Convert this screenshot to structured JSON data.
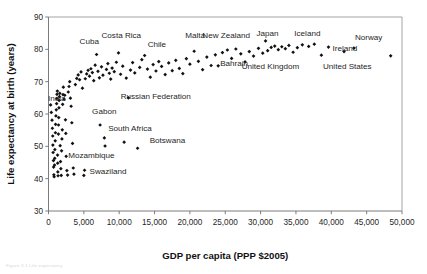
{
  "figure": {
    "caption_fragment": "Figure 3.1  Life expectancy"
  },
  "chart_data": {
    "type": "scatter",
    "title": "",
    "xlabel": "GDP per capita (PPP $2005)",
    "ylabel": "Life expectancy at birth (years)",
    "xlim": [
      0,
      50000
    ],
    "ylim": [
      30,
      90
    ],
    "xticks": [
      0,
      5000,
      10000,
      15000,
      20000,
      25000,
      30000,
      35000,
      40000,
      45000,
      50000
    ],
    "xticklabels": [
      "0",
      "5,000",
      "10,000",
      "15,000",
      "20,000",
      "25,000",
      "30,000",
      "35,000",
      "40,000",
      "45,000",
      "50,000"
    ],
    "yticks": [
      30,
      40,
      50,
      60,
      70,
      80,
      90
    ],
    "yticklabels": [
      "30",
      "40",
      "50",
      "60",
      "70",
      "80",
      "90"
    ],
    "grid": false,
    "legend": false,
    "marker": "diamond",
    "marker_color": "#111111",
    "annotations": [
      {
        "label": "Cuba",
        "x": 6800,
        "y": 80.5
      },
      {
        "label": "Costa Rica",
        "x": 9900,
        "y": 81.5
      },
      {
        "label": "Chile",
        "x": 13600,
        "y": 79.6
      },
      {
        "label": "Malta",
        "x": 20600,
        "y": 81.7
      },
      {
        "label": "New Zealand",
        "x": 25300,
        "y": 81.6
      },
      {
        "label": "Japan",
        "x": 30700,
        "y": 82.2
      },
      {
        "label": "Iceland",
        "x": 35900,
        "y": 82.2
      },
      {
        "label": "Norway",
        "x": 43200,
        "y": 81.3
      },
      {
        "label": "Ireland",
        "x": 39600,
        "y": 79.7
      },
      {
        "label": "United Kingdom",
        "x": 31000,
        "y": 77.6
      },
      {
        "label": "United States",
        "x": 41800,
        "y": 77.4
      },
      {
        "label": "Bahrain",
        "x": 24000,
        "y": 77.1
      },
      {
        "label": "India",
        "x": 2200,
        "y": 64.6
      },
      {
        "label": "Russian Federation",
        "x": 13600,
        "y": 68.3
      },
      {
        "label": "Gabon",
        "x": 7300,
        "y": 58.6
      },
      {
        "label": "South Africa",
        "x": 10700,
        "y": 53.2
      },
      {
        "label": "Botswana",
        "x": 13600,
        "y": 51.9
      },
      {
        "label": "Mozambique",
        "x": 2500,
        "y": 46.9
      },
      {
        "label": "Swaziland",
        "x": 5100,
        "y": 42.6
      }
    ],
    "points": [
      {
        "x": 300,
        "y": 62.8
      },
      {
        "x": 400,
        "y": 60.5
      },
      {
        "x": 500,
        "y": 58.1
      },
      {
        "x": 550,
        "y": 55.6
      },
      {
        "x": 600,
        "y": 53.2
      },
      {
        "x": 620,
        "y": 50.4
      },
      {
        "x": 650,
        "y": 48.1
      },
      {
        "x": 700,
        "y": 45.6
      },
      {
        "x": 720,
        "y": 43.6
      },
      {
        "x": 760,
        "y": 41.2
      },
      {
        "x": 800,
        "y": 40.6
      },
      {
        "x": 850,
        "y": 44.2
      },
      {
        "x": 880,
        "y": 46.3
      },
      {
        "x": 900,
        "y": 49.0
      },
      {
        "x": 950,
        "y": 51.7
      },
      {
        "x": 980,
        "y": 54.2
      },
      {
        "x": 1000,
        "y": 56.8
      },
      {
        "x": 1050,
        "y": 59.4
      },
      {
        "x": 1100,
        "y": 61.3
      },
      {
        "x": 1150,
        "y": 63.2
      },
      {
        "x": 1180,
        "y": 64.8
      },
      {
        "x": 1200,
        "y": 66.1
      },
      {
        "x": 1250,
        "y": 67.1
      },
      {
        "x": 1280,
        "y": 47.3
      },
      {
        "x": 1300,
        "y": 44.8
      },
      {
        "x": 1320,
        "y": 42.1
      },
      {
        "x": 1350,
        "y": 40.9
      },
      {
        "x": 1400,
        "y": 53.8
      },
      {
        "x": 1420,
        "y": 56.6
      },
      {
        "x": 1450,
        "y": 58.9
      },
      {
        "x": 1480,
        "y": 61.9
      },
      {
        "x": 1500,
        "y": 64.2
      },
      {
        "x": 1550,
        "y": 65.4
      },
      {
        "x": 1600,
        "y": 66.4
      },
      {
        "x": 1650,
        "y": 50.2
      },
      {
        "x": 1700,
        "y": 45.3
      },
      {
        "x": 1750,
        "y": 43.1
      },
      {
        "x": 1800,
        "y": 41.0
      },
      {
        "x": 1850,
        "y": 48.6
      },
      {
        "x": 1900,
        "y": 52.3
      },
      {
        "x": 1950,
        "y": 55.1
      },
      {
        "x": 2000,
        "y": 63.0
      },
      {
        "x": 2050,
        "y": 66.0
      },
      {
        "x": 2100,
        "y": 68.3
      },
      {
        "x": 2200,
        "y": 64.6
      },
      {
        "x": 2300,
        "y": 65.8
      },
      {
        "x": 2400,
        "y": 58.2
      },
      {
        "x": 2450,
        "y": 54.0
      },
      {
        "x": 2500,
        "y": 46.9
      },
      {
        "x": 2600,
        "y": 42.5
      },
      {
        "x": 2700,
        "y": 41.1
      },
      {
        "x": 2800,
        "y": 66.8
      },
      {
        "x": 2900,
        "y": 68.5
      },
      {
        "x": 3000,
        "y": 70.0
      },
      {
        "x": 3100,
        "y": 64.9
      },
      {
        "x": 3200,
        "y": 62.4
      },
      {
        "x": 3300,
        "y": 57.3
      },
      {
        "x": 3400,
        "y": 50.9
      },
      {
        "x": 3500,
        "y": 43.3
      },
      {
        "x": 3600,
        "y": 41.4
      },
      {
        "x": 3800,
        "y": 69.1
      },
      {
        "x": 4000,
        "y": 71.0
      },
      {
        "x": 4200,
        "y": 72.1
      },
      {
        "x": 4400,
        "y": 70.6
      },
      {
        "x": 4600,
        "y": 73.0
      },
      {
        "x": 4800,
        "y": 68.0
      },
      {
        "x": 5000,
        "y": 41.0
      },
      {
        "x": 5100,
        "y": 42.6
      },
      {
        "x": 5200,
        "y": 70.9
      },
      {
        "x": 5400,
        "y": 72.4
      },
      {
        "x": 5600,
        "y": 73.5
      },
      {
        "x": 5800,
        "y": 71.7
      },
      {
        "x": 6000,
        "y": 74.0
      },
      {
        "x": 6200,
        "y": 72.8
      },
      {
        "x": 6400,
        "y": 70.3
      },
      {
        "x": 6600,
        "y": 75.1
      },
      {
        "x": 6800,
        "y": 78.4
      },
      {
        "x": 7000,
        "y": 73.2
      },
      {
        "x": 7200,
        "y": 71.2
      },
      {
        "x": 7300,
        "y": 56.6
      },
      {
        "x": 7500,
        "y": 74.6
      },
      {
        "x": 7700,
        "y": 72.0
      },
      {
        "x": 7900,
        "y": 52.6
      },
      {
        "x": 8000,
        "y": 50.1
      },
      {
        "x": 8200,
        "y": 73.8
      },
      {
        "x": 8400,
        "y": 75.6
      },
      {
        "x": 8600,
        "y": 72.6
      },
      {
        "x": 8800,
        "y": 70.8
      },
      {
        "x": 9000,
        "y": 74.2
      },
      {
        "x": 9300,
        "y": 73.1
      },
      {
        "x": 9600,
        "y": 76.0
      },
      {
        "x": 9900,
        "y": 78.9
      },
      {
        "x": 10200,
        "y": 72.3
      },
      {
        "x": 10500,
        "y": 74.8
      },
      {
        "x": 10700,
        "y": 51.3
      },
      {
        "x": 11000,
        "y": 71.1
      },
      {
        "x": 11300,
        "y": 65.0
      },
      {
        "x": 11600,
        "y": 73.6
      },
      {
        "x": 11900,
        "y": 75.9
      },
      {
        "x": 12200,
        "y": 72.7
      },
      {
        "x": 12600,
        "y": 49.4
      },
      {
        "x": 12900,
        "y": 74.4
      },
      {
        "x": 13200,
        "y": 76.8
      },
      {
        "x": 13600,
        "y": 78.1
      },
      {
        "x": 14000,
        "y": 73.9
      },
      {
        "x": 14400,
        "y": 71.4
      },
      {
        "x": 14800,
        "y": 75.3
      },
      {
        "x": 15200,
        "y": 73.3
      },
      {
        "x": 15600,
        "y": 76.2
      },
      {
        "x": 16000,
        "y": 74.7
      },
      {
        "x": 16500,
        "y": 72.2
      },
      {
        "x": 17000,
        "y": 75.8
      },
      {
        "x": 17500,
        "y": 73.4
      },
      {
        "x": 18000,
        "y": 76.6
      },
      {
        "x": 18500,
        "y": 74.1
      },
      {
        "x": 19000,
        "y": 72.5
      },
      {
        "x": 19500,
        "y": 77.1
      },
      {
        "x": 20000,
        "y": 75.4
      },
      {
        "x": 20600,
        "y": 79.4
      },
      {
        "x": 21200,
        "y": 76.3
      },
      {
        "x": 21800,
        "y": 73.7
      },
      {
        "x": 22400,
        "y": 77.6
      },
      {
        "x": 23000,
        "y": 75.0
      },
      {
        "x": 23600,
        "y": 78.3
      },
      {
        "x": 24000,
        "y": 74.9
      },
      {
        "x": 24600,
        "y": 79.0
      },
      {
        "x": 25300,
        "y": 79.8
      },
      {
        "x": 25900,
        "y": 77.2
      },
      {
        "x": 26500,
        "y": 80.1
      },
      {
        "x": 27200,
        "y": 78.6
      },
      {
        "x": 27800,
        "y": 76.1
      },
      {
        "x": 28400,
        "y": 79.3
      },
      {
        "x": 29000,
        "y": 77.9
      },
      {
        "x": 29700,
        "y": 80.3
      },
      {
        "x": 30300,
        "y": 78.8
      },
      {
        "x": 30700,
        "y": 82.6
      },
      {
        "x": 31000,
        "y": 79.6
      },
      {
        "x": 31500,
        "y": 80.6
      },
      {
        "x": 32000,
        "y": 81.0
      },
      {
        "x": 32500,
        "y": 79.9
      },
      {
        "x": 33000,
        "y": 80.8
      },
      {
        "x": 33500,
        "y": 80.2
      },
      {
        "x": 34000,
        "y": 81.2
      },
      {
        "x": 34600,
        "y": 79.1
      },
      {
        "x": 35200,
        "y": 80.5
      },
      {
        "x": 35900,
        "y": 81.4
      },
      {
        "x": 36800,
        "y": 80.9
      },
      {
        "x": 37600,
        "y": 81.6
      },
      {
        "x": 38600,
        "y": 78.2
      },
      {
        "x": 39600,
        "y": 80.7
      },
      {
        "x": 41800,
        "y": 79.3
      },
      {
        "x": 43200,
        "y": 80.4
      },
      {
        "x": 48400,
        "y": 78.0
      }
    ]
  }
}
